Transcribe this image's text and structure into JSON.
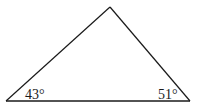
{
  "diagram": {
    "type": "triangle",
    "vertices": {
      "apex": [
        110,
        7
      ],
      "bottom_left": [
        6,
        101
      ],
      "bottom_right": [
        190,
        101
      ]
    },
    "stroke_color": "#1a1a1a",
    "angles": {
      "bottom_left": "43°",
      "bottom_right": "51°"
    }
  }
}
